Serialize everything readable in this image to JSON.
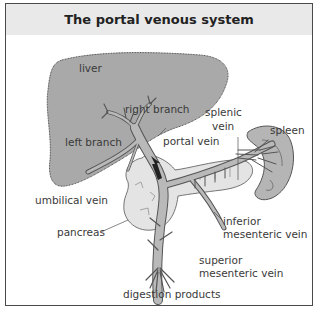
{
  "title": "The portal venous system",
  "colors": {
    "liver": "#a9a9a9",
    "vein": "#b9b9b9",
    "pancreas": "#e4e4e4",
    "spleen": "#b5b5b5",
    "outline": "#555555",
    "header_bg": "#e9e9e9",
    "frame_border": "#4a4a4a"
  },
  "labels": {
    "liver": "liver",
    "right_branch": "right branch",
    "left_branch": "left branch",
    "splenic_vein_1": "splenic",
    "splenic_vein_2": "vein",
    "spleen": "spleen",
    "portal_vein": "portal vein",
    "umbilical_vein": "umbilical vein",
    "pancreas": "pancreas",
    "inferior_mesenteric_1": "inferior",
    "inferior_mesenteric_2": "mesenteric vein",
    "superior_mesenteric_1": "superior",
    "superior_mesenteric_2": "mesenteric vein",
    "digestion_products": "digestion products"
  }
}
